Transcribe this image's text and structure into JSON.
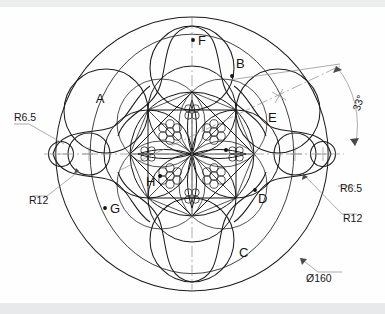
{
  "drawing": {
    "title": "Ornamental rosette circular pattern",
    "background_color": "#fefefe",
    "line_color": "#1b1b1b",
    "dimension_color": "#8a8a8a",
    "centerline_color": "#8d8d8d"
  },
  "dimensions": [
    {
      "id": "dia-outer",
      "text": "Ø160",
      "kind": "diameter",
      "value": 160,
      "position": "bottom-right"
    },
    {
      "id": "r65-left",
      "text": "R6.5",
      "kind": "radius",
      "value": 6.5,
      "position": "left-upper"
    },
    {
      "id": "r12-left",
      "text": "R12",
      "kind": "radius",
      "value": 12,
      "position": "left-lower"
    },
    {
      "id": "r65-right",
      "text": "R6.5",
      "kind": "radius",
      "value": 6.5,
      "position": "right-upper"
    },
    {
      "id": "r12-right",
      "text": "R12",
      "kind": "radius",
      "value": 12,
      "position": "right-lower"
    },
    {
      "id": "angle-33",
      "text": "33°",
      "kind": "angle",
      "value": 33,
      "position": "upper-right"
    }
  ],
  "labels": [
    {
      "id": "label-a",
      "text": "A",
      "has_dot": false
    },
    {
      "id": "label-b",
      "text": "B",
      "has_dot": true
    },
    {
      "id": "label-c",
      "text": "C",
      "has_dot": false
    },
    {
      "id": "label-d",
      "text": "D",
      "has_dot": true
    },
    {
      "id": "label-e",
      "text": "E",
      "has_dot": false
    },
    {
      "id": "label-f",
      "text": "F",
      "has_dot": true
    },
    {
      "id": "label-g",
      "text": "G",
      "has_dot": true
    },
    {
      "id": "label-h",
      "text": "H",
      "has_dot": true
    }
  ]
}
